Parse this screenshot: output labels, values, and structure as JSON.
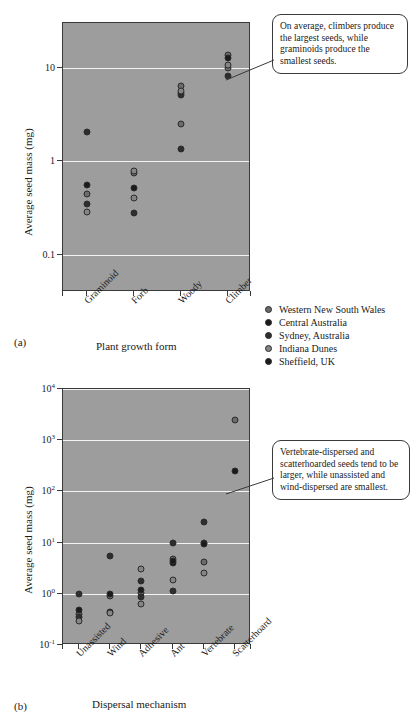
{
  "figure": {
    "background": "#ffffff",
    "plot_background": "#9d9d9d",
    "gridline_color": "#f3f3f3",
    "axis_color": "#3a3a3a"
  },
  "legend": {
    "position": "right-middle",
    "items": [
      {
        "label": "Western New South Wales",
        "color": "#6b6b6b"
      },
      {
        "label": "Central Australia",
        "color": "#1b1b1b"
      },
      {
        "label": "Sydney, Australia",
        "color": "#2e2e2e"
      },
      {
        "label": "Indiana Dunes",
        "color": "#858585"
      },
      {
        "label": "Sheffield, UK",
        "color": "#1b1b1b"
      }
    ]
  },
  "panel_a": {
    "panel_label": "(a)",
    "callout": "On average, climbers produce the largest seeds, while graminoids produce the smallest seeds.",
    "chart_data": {
      "type": "scatter",
      "title": "",
      "xlabel": "Plant growth form",
      "ylabel": "Average seed mass (mg)",
      "yscale": "log",
      "ylim": [
        0.04,
        30
      ],
      "ytick_values": [
        0.1,
        1,
        10
      ],
      "ytick_labels": [
        "0.1",
        "1",
        "10"
      ],
      "grid": "horizontal",
      "categories": [
        "Graminoid",
        "Forb",
        "Woody",
        "Climber"
      ],
      "series": [
        {
          "name": "Western New South Wales",
          "color": "#6b6b6b",
          "points": [
            {
              "category": "Graminoid",
              "value": 0.45
            },
            {
              "category": "Forb",
              "value": 0.74
            },
            {
              "category": "Woody",
              "value": 6.3
            },
            {
              "category": "Woody",
              "value": 2.5
            },
            {
              "category": "Climber",
              "value": 13.5
            },
            {
              "category": "Climber",
              "value": 9.9
            }
          ]
        },
        {
          "name": "Central Australia",
          "color": "#1b1b1b",
          "points": [
            {
              "category": "Graminoid",
              "value": 0.56
            },
            {
              "category": "Forb",
              "value": 0.52
            },
            {
              "category": "Woody",
              "value": 5.4
            },
            {
              "category": "Climber",
              "value": 12.6
            }
          ]
        },
        {
          "name": "Sydney, Australia",
          "color": "#2e2e2e",
          "points": [
            {
              "category": "Graminoid",
              "value": 0.35
            },
            {
              "category": "Graminoid",
              "value": 2.05
            },
            {
              "category": "Forb",
              "value": 0.28
            },
            {
              "category": "Woody",
              "value": 5.1
            },
            {
              "category": "Woody",
              "value": 1.35
            },
            {
              "category": "Climber",
              "value": 8.2
            }
          ]
        },
        {
          "name": "Indiana Dunes",
          "color": "#858585",
          "points": [
            {
              "category": "Graminoid",
              "value": 0.29
            },
            {
              "category": "Forb",
              "value": 0.78
            },
            {
              "category": "Forb",
              "value": 0.4
            },
            {
              "category": "Woody",
              "value": 5.7
            },
            {
              "category": "Climber",
              "value": 10.6
            }
          ]
        }
      ]
    }
  },
  "panel_b": {
    "panel_label": "(b)",
    "callout": "Vertebrate-dispersed and scatterhoarded seeds tend to be larger, while unassisted and wind-dispersed are smallest.",
    "chart_data": {
      "type": "scatter",
      "title": "",
      "xlabel": "Dispersal mechanism",
      "ylabel": "Average seed mass (mg)",
      "yscale": "log",
      "ylim": [
        0.1,
        10000
      ],
      "ytick_values": [
        0.1,
        1,
        10,
        100,
        1000,
        10000
      ],
      "ytick_labels": [
        "10-1",
        "100",
        "101",
        "102",
        "103",
        "104"
      ],
      "ytick_exponents": [
        "-1",
        "0",
        "1",
        "2",
        "3",
        "4"
      ],
      "grid": "horizontal",
      "categories": [
        "Unassisted",
        "Wind",
        "Adhesive",
        "Ant",
        "Vertebrate",
        "Scatterhoard"
      ],
      "series": [
        {
          "name": "Western New South Wales",
          "color": "#6b6b6b",
          "points": [
            {
              "category": "Unassisted",
              "value": 0.4
            },
            {
              "category": "Wind",
              "value": 0.92
            },
            {
              "category": "Adhesive",
              "value": 1.05
            },
            {
              "category": "Ant",
              "value": 4.9
            },
            {
              "category": "Vertebrate",
              "value": 4.1
            },
            {
              "category": "Scatterhoard",
              "value": 2500
            }
          ]
        },
        {
          "name": "Central Australia",
          "color": "#1b1b1b",
          "points": [
            {
              "category": "Unassisted",
              "value": 0.48
            },
            {
              "category": "Wind",
              "value": 0.98
            },
            {
              "category": "Adhesive",
              "value": 1.18
            },
            {
              "category": "Ant",
              "value": 4.0
            },
            {
              "category": "Vertebrate",
              "value": 10.0
            },
            {
              "category": "Scatterhoard",
              "value": 250
            }
          ]
        },
        {
          "name": "Sydney, Australia",
          "color": "#2e2e2e",
          "points": [
            {
              "category": "Unassisted",
              "value": 1.0
            },
            {
              "category": "Unassisted",
              "value": 0.36
            },
            {
              "category": "Wind",
              "value": 5.4
            },
            {
              "category": "Wind",
              "value": 0.45
            },
            {
              "category": "Adhesive",
              "value": 1.8
            },
            {
              "category": "Adhesive",
              "value": 0.88
            },
            {
              "category": "Ant",
              "value": 9.9
            },
            {
              "category": "Ant",
              "value": 1.15
            },
            {
              "category": "Vertebrate",
              "value": 25.0
            }
          ]
        },
        {
          "name": "Indiana Dunes",
          "color": "#858585",
          "points": [
            {
              "category": "Unassisted",
              "value": 0.3
            },
            {
              "category": "Wind",
              "value": 0.43
            },
            {
              "category": "Adhesive",
              "value": 3.0
            },
            {
              "category": "Adhesive",
              "value": 0.64
            },
            {
              "category": "Ant",
              "value": 1.85
            },
            {
              "category": "Vertebrate",
              "value": 2.5
            }
          ]
        },
        {
          "name": "Sheffield, UK",
          "color": "#1b1b1b",
          "points": [
            {
              "category": "Ant",
              "value": 4.4
            },
            {
              "category": "Vertebrate",
              "value": 9.6
            }
          ]
        }
      ]
    }
  }
}
